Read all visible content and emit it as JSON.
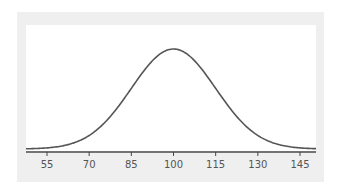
{
  "chart_data": {
    "type": "line",
    "title": "",
    "xlabel": "",
    "ylabel": "",
    "mean": 100,
    "sd": 15,
    "x_ticks": [
      55,
      70,
      85,
      100,
      115,
      130,
      145
    ],
    "tick_labels": [
      "55",
      "70",
      "85",
      "100",
      "115",
      "130",
      "145"
    ],
    "xlim": [
      47,
      152
    ],
    "grid": false,
    "legend": null,
    "colors": {
      "line": "#555555",
      "panel": "#efefef",
      "plot": "#ffffff",
      "axis": "#444444"
    }
  }
}
